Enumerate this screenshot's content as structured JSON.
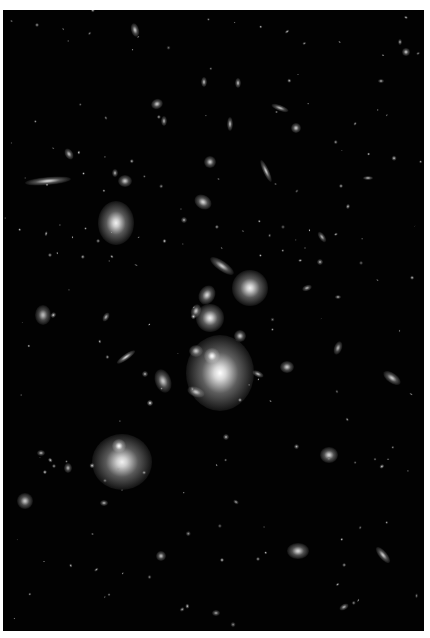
{
  "image": {
    "subject": "galaxy cluster deep field",
    "background_color": "#020202",
    "frame": {
      "x": 3,
      "y": 10,
      "w": 421,
      "h": 621
    }
  },
  "galaxies": [
    {
      "x": 220,
      "y": 373,
      "rx": 34,
      "ry": 38,
      "rot": 0,
      "b": 1.0
    },
    {
      "x": 212,
      "y": 356,
      "rx": 8,
      "ry": 8,
      "rot": 0,
      "b": 1.0
    },
    {
      "x": 122,
      "y": 462,
      "rx": 30,
      "ry": 28,
      "rot": 0,
      "b": 0.95
    },
    {
      "x": 119,
      "y": 446,
      "rx": 7,
      "ry": 7,
      "rot": 0,
      "b": 1.0
    },
    {
      "x": 116,
      "y": 223,
      "rx": 18,
      "ry": 22,
      "rot": 0,
      "b": 0.95
    },
    {
      "x": 250,
      "y": 288,
      "rx": 18,
      "ry": 18,
      "rot": 0,
      "b": 0.95
    },
    {
      "x": 210,
      "y": 318,
      "rx": 14,
      "ry": 14,
      "rot": 0,
      "b": 0.95
    },
    {
      "x": 207,
      "y": 295,
      "rx": 8,
      "ry": 10,
      "rot": 30,
      "b": 0.85
    },
    {
      "x": 196,
      "y": 311,
      "rx": 5,
      "ry": 7,
      "rot": 20,
      "b": 0.8
    },
    {
      "x": 222,
      "y": 266,
      "rx": 14,
      "ry": 5,
      "rot": 35,
      "b": 0.8
    },
    {
      "x": 48,
      "y": 181,
      "rx": 23,
      "ry": 4,
      "rot": -5,
      "b": 0.85
    },
    {
      "x": 43,
      "y": 315,
      "rx": 8,
      "ry": 10,
      "rot": 0,
      "b": 0.75
    },
    {
      "x": 163,
      "y": 381,
      "rx": 8,
      "ry": 12,
      "rot": -20,
      "b": 0.8
    },
    {
      "x": 126,
      "y": 357,
      "rx": 11,
      "ry": 3,
      "rot": -35,
      "b": 0.85
    },
    {
      "x": 196,
      "y": 392,
      "rx": 9,
      "ry": 5,
      "rot": 20,
      "b": 0.8
    },
    {
      "x": 196,
      "y": 351,
      "rx": 7,
      "ry": 6,
      "rot": 0,
      "b": 0.8
    },
    {
      "x": 240,
      "y": 336,
      "rx": 6,
      "ry": 6,
      "rot": 0,
      "b": 0.8
    },
    {
      "x": 287,
      "y": 367,
      "rx": 7,
      "ry": 6,
      "rot": 0,
      "b": 0.8
    },
    {
      "x": 258,
      "y": 374,
      "rx": 6,
      "ry": 3,
      "rot": 25,
      "b": 0.75
    },
    {
      "x": 329,
      "y": 455,
      "rx": 9,
      "ry": 8,
      "rot": 0,
      "b": 0.85
    },
    {
      "x": 392,
      "y": 378,
      "rx": 10,
      "ry": 5,
      "rot": 35,
      "b": 0.8
    },
    {
      "x": 338,
      "y": 348,
      "rx": 4,
      "ry": 7,
      "rot": 20,
      "b": 0.7
    },
    {
      "x": 298,
      "y": 551,
      "rx": 11,
      "ry": 8,
      "rot": 0,
      "b": 0.85
    },
    {
      "x": 383,
      "y": 555,
      "rx": 4,
      "ry": 10,
      "rot": -40,
      "b": 0.8
    },
    {
      "x": 161,
      "y": 556,
      "rx": 5,
      "ry": 5,
      "rot": 0,
      "b": 0.75
    },
    {
      "x": 25,
      "y": 501,
      "rx": 8,
      "ry": 8,
      "rot": 0,
      "b": 0.8
    },
    {
      "x": 68,
      "y": 468,
      "rx": 4,
      "ry": 5,
      "rot": 0,
      "b": 0.7
    },
    {
      "x": 41,
      "y": 453,
      "rx": 4,
      "ry": 3,
      "rot": 0,
      "b": 0.7
    },
    {
      "x": 203,
      "y": 202,
      "rx": 9,
      "ry": 7,
      "rot": 30,
      "b": 0.85
    },
    {
      "x": 125,
      "y": 181,
      "rx": 7,
      "ry": 6,
      "rot": 0,
      "b": 0.8
    },
    {
      "x": 115,
      "y": 173,
      "rx": 3,
      "ry": 4,
      "rot": 0,
      "b": 0.7
    },
    {
      "x": 210,
      "y": 162,
      "rx": 6,
      "ry": 6,
      "rot": 0,
      "b": 0.8
    },
    {
      "x": 69,
      "y": 154,
      "rx": 4,
      "ry": 6,
      "rot": -30,
      "b": 0.75
    },
    {
      "x": 157,
      "y": 104,
      "rx": 6,
      "ry": 5,
      "rot": -20,
      "b": 0.8
    },
    {
      "x": 164,
      "y": 121,
      "rx": 3,
      "ry": 5,
      "rot": 0,
      "b": 0.7
    },
    {
      "x": 266,
      "y": 171,
      "rx": 3,
      "ry": 12,
      "rot": -25,
      "b": 0.8
    },
    {
      "x": 296,
      "y": 128,
      "rx": 5,
      "ry": 5,
      "rot": 0,
      "b": 0.8
    },
    {
      "x": 280,
      "y": 108,
      "rx": 9,
      "ry": 3,
      "rot": 20,
      "b": 0.75
    },
    {
      "x": 230,
      "y": 124,
      "rx": 3,
      "ry": 7,
      "rot": 0,
      "b": 0.75
    },
    {
      "x": 135,
      "y": 30,
      "rx": 4,
      "ry": 7,
      "rot": -15,
      "b": 0.8
    },
    {
      "x": 204,
      "y": 82,
      "rx": 3,
      "ry": 5,
      "rot": 0,
      "b": 0.75
    },
    {
      "x": 238,
      "y": 83,
      "rx": 3,
      "ry": 5,
      "rot": 0,
      "b": 0.75
    },
    {
      "x": 406,
      "y": 52,
      "rx": 4,
      "ry": 4,
      "rot": 0,
      "b": 0.8
    },
    {
      "x": 400,
      "y": 42,
      "rx": 2,
      "ry": 3,
      "rot": 0,
      "b": 0.7
    },
    {
      "x": 381,
      "y": 81,
      "rx": 3,
      "ry": 2,
      "rot": 0,
      "b": 0.7
    },
    {
      "x": 322,
      "y": 237,
      "rx": 3,
      "ry": 6,
      "rot": -35,
      "b": 0.7
    },
    {
      "x": 320,
      "y": 262,
      "rx": 3,
      "ry": 3,
      "rot": 0,
      "b": 0.7
    },
    {
      "x": 368,
      "y": 178,
      "rx": 5,
      "ry": 2,
      "rot": 0,
      "b": 0.75
    },
    {
      "x": 338,
      "y": 297,
      "rx": 3,
      "ry": 2,
      "rot": 0,
      "b": 0.7
    },
    {
      "x": 307,
      "y": 288,
      "rx": 5,
      "ry": 3,
      "rot": -20,
      "b": 0.7
    },
    {
      "x": 341,
      "y": 186,
      "rx": 2,
      "ry": 2,
      "rot": 0,
      "b": 0.7
    },
    {
      "x": 106,
      "y": 317,
      "rx": 3,
      "ry": 5,
      "rot": 30,
      "b": 0.7
    },
    {
      "x": 184,
      "y": 220,
      "rx": 3,
      "ry": 3,
      "rot": 0,
      "b": 0.7
    },
    {
      "x": 145,
      "y": 374,
      "rx": 3,
      "ry": 3,
      "rot": 0,
      "b": 0.7
    },
    {
      "x": 226,
      "y": 437,
      "rx": 3,
      "ry": 3,
      "rot": 0,
      "b": 0.7
    },
    {
      "x": 104,
      "y": 503,
      "rx": 4,
      "ry": 3,
      "rot": 0,
      "b": 0.7
    },
    {
      "x": 236,
      "y": 502,
      "rx": 3,
      "ry": 2,
      "rot": 30,
      "b": 0.65
    },
    {
      "x": 344,
      "y": 607,
      "rx": 5,
      "ry": 3,
      "rot": -30,
      "b": 0.7
    },
    {
      "x": 216,
      "y": 613,
      "rx": 4,
      "ry": 3,
      "rot": 0,
      "b": 0.65
    },
    {
      "x": 258,
      "y": 559,
      "rx": 2,
      "ry": 2,
      "rot": 0,
      "b": 0.65
    },
    {
      "x": 150,
      "y": 403,
      "rx": 3,
      "ry": 3,
      "rot": 0,
      "b": 0.9
    }
  ],
  "specks_seed": 137,
  "specks_count": 160
}
